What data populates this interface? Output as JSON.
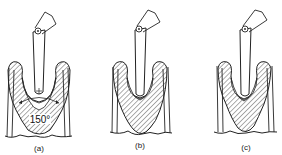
{
  "figure": {
    "panels": [
      {
        "label": "(a)",
        "angle_annotation": "150°"
      },
      {
        "label": "(b)"
      },
      {
        "label": "(c)"
      }
    ]
  }
}
